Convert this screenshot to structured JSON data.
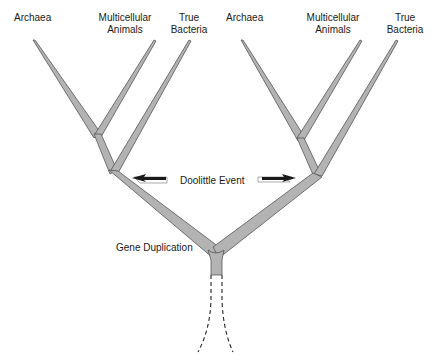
{
  "diagram": {
    "type": "phylogenetic-tree",
    "left_tree": {
      "leaves": [
        "Archaea",
        "Multicellular Animals",
        "True Bacteria"
      ],
      "labels": {
        "archaea": "Archaea",
        "multicellular_line1": "Multicellular",
        "multicellular_line2": "Animals",
        "bacteria_line1": "True",
        "bacteria_line2": "Bacteria"
      }
    },
    "right_tree": {
      "leaves": [
        "Archaea",
        "Multicellular Animals",
        "True Bacteria"
      ],
      "labels": {
        "archaea": "Archaea",
        "multicellular_line1": "Multicellular",
        "multicellular_line2": "Animals",
        "bacteria_line1": "True",
        "bacteria_line2": "Bacteria"
      }
    },
    "event_label": "Doolittle Event",
    "root_label": "Gene Duplication",
    "colors": {
      "branch_fill": "#b3b3b3",
      "branch_stroke": "#555555",
      "arrow": "#1a1a1a",
      "text": "#1a1a1a"
    }
  }
}
